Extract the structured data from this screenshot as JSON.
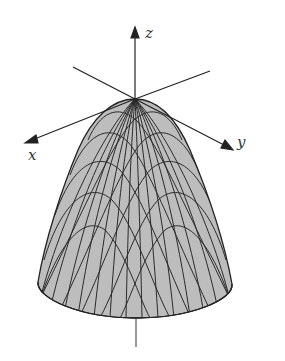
{
  "figure": {
    "surface_fill": "#bdbdbd",
    "mesh_color": "#2a2a2a",
    "axis_color": "#222222",
    "background": "#ffffff"
  },
  "axes": {
    "x": {
      "label": "x"
    },
    "y": {
      "label": "y"
    },
    "z": {
      "label": "z"
    }
  }
}
